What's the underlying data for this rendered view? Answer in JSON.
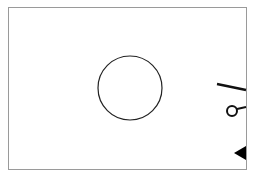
{
  "diagram": {
    "type": "line-drawing",
    "colors": {
      "stroke": "#222222",
      "background": "#ffffff",
      "frame": "#9a9a9a"
    },
    "elements": [
      {
        "name": "frame",
        "shape": "rectangle"
      },
      {
        "name": "center-circle",
        "shape": "circle"
      },
      {
        "name": "slanted-line",
        "shape": "line"
      },
      {
        "name": "small-circle-lever",
        "shape": "circle-with-line"
      },
      {
        "name": "triangle-marker",
        "shape": "triangle"
      }
    ]
  }
}
